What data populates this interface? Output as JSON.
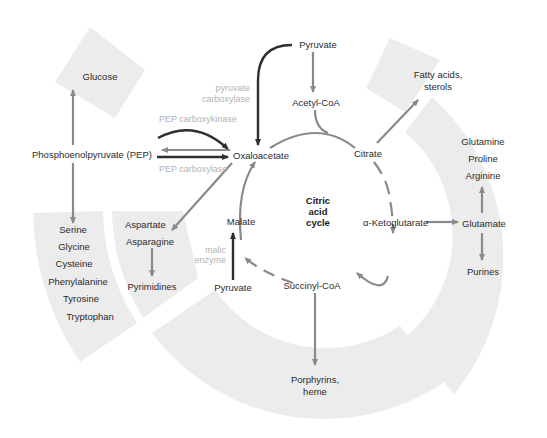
{
  "diagram": {
    "center_label": [
      "Citric",
      "acid",
      "cycle"
    ],
    "cycle_intermediates": {
      "oxaloacetate": "Oxaloacetate",
      "citrate": "Citrate",
      "alpha_ketoglutarate": "α-Ketoglutarate",
      "succinyl_coa": "Succinyl-CoA",
      "malate": "Malate"
    },
    "inputs": {
      "pyruvate_top": "Pyruvate",
      "acetyl_coa": "Acetyl-CoA",
      "pyruvate_bottom": "Pyruvate",
      "pep": "Phosphoenolpyruvate (PEP)"
    },
    "enzymes": {
      "pyruvate_carboxylase": [
        "pyruvate",
        "carboxylase"
      ],
      "pep_carboxykinase": "PEP carboxykinase",
      "pep_carboxylase": "PEP carboxylase",
      "malic_enzyme": [
        "malic",
        "enzyme"
      ]
    },
    "products": {
      "glucose": "Glucose",
      "fatty_acids": [
        "Fatty acids,",
        "sterols"
      ],
      "serine_family": [
        "Serine",
        "Glycine",
        "Cysteine",
        "Phenylalanine",
        "Tyrosine",
        "Tryptophan"
      ],
      "aspartate_family": [
        "Aspartate",
        "Asparagine"
      ],
      "pyrimidines": "Pyrimidines",
      "glutamate_family": [
        "Glutamine",
        "Proline",
        "Arginine"
      ],
      "glutamate": "Glutamate",
      "purines": "Purines",
      "porphyrins": [
        "Porphyrins,",
        "heme"
      ]
    },
    "colors": {
      "panel": "#ececec",
      "arrow_gray": "#8a8a8a",
      "arrow_dark": "#2e2e2e",
      "enzyme_text": "#b3b3b3",
      "text": "#2b2b2b"
    }
  }
}
